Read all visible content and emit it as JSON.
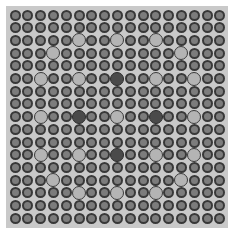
{
  "grid": {
    "rows": 17,
    "cols": 17,
    "origin_x": 15,
    "origin_y": 15,
    "spacing_x": 12.8,
    "spacing_y": 12.7,
    "colors": {
      "background": "#c9c9c9",
      "normal_fill": "#7c7c7c",
      "light_fill": "#b4b4b4",
      "dark_fill": "#4a4a4a",
      "outline": "#383838"
    },
    "special": [
      {
        "row": 2,
        "col": 5,
        "type": "light"
      },
      {
        "row": 2,
        "col": 8,
        "type": "light"
      },
      {
        "row": 2,
        "col": 11,
        "type": "light"
      },
      {
        "row": 3,
        "col": 3,
        "type": "light"
      },
      {
        "row": 3,
        "col": 13,
        "type": "light"
      },
      {
        "row": 5,
        "col": 2,
        "type": "light"
      },
      {
        "row": 5,
        "col": 5,
        "type": "light"
      },
      {
        "row": 5,
        "col": 8,
        "type": "dark"
      },
      {
        "row": 5,
        "col": 11,
        "type": "light"
      },
      {
        "row": 5,
        "col": 14,
        "type": "light"
      },
      {
        "row": 8,
        "col": 2,
        "type": "light"
      },
      {
        "row": 8,
        "col": 5,
        "type": "dark"
      },
      {
        "row": 8,
        "col": 8,
        "type": "light"
      },
      {
        "row": 8,
        "col": 11,
        "type": "dark"
      },
      {
        "row": 8,
        "col": 14,
        "type": "light"
      },
      {
        "row": 11,
        "col": 2,
        "type": "light"
      },
      {
        "row": 11,
        "col": 5,
        "type": "light"
      },
      {
        "row": 11,
        "col": 8,
        "type": "dark"
      },
      {
        "row": 11,
        "col": 11,
        "type": "light"
      },
      {
        "row": 11,
        "col": 14,
        "type": "light"
      },
      {
        "row": 13,
        "col": 3,
        "type": "light"
      },
      {
        "row": 13,
        "col": 13,
        "type": "light"
      },
      {
        "row": 14,
        "col": 5,
        "type": "light"
      },
      {
        "row": 14,
        "col": 8,
        "type": "light"
      },
      {
        "row": 14,
        "col": 11,
        "type": "light"
      }
    ]
  }
}
